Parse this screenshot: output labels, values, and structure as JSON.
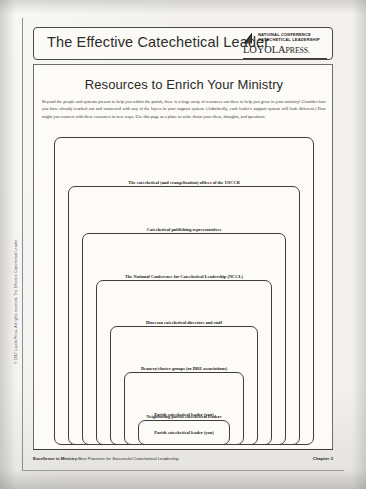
{
  "header": {
    "title": "The Effective Catechetical Leader",
    "logo": {
      "mark_name": "nccl-triangle-mark",
      "line1": "NATIONAL CONFERENCE",
      "line2": "CATECHETICAL LEADERSHIP",
      "wordmark_primary": "LOYOLA",
      "wordmark_secondary": "PRESS."
    }
  },
  "main": {
    "heading": "Resources to Enrich Your Ministry",
    "intro": "Beyond the people and systems present to help you within the parish, there is a large array of resources out there to help you grow in your ministry! Consider how you have already reached out and connected with any of the layers in your support system. (Admittedly, each leader's support system will look different.) How might you connect with these resources in new ways. Use this page as a place to write down your ideas, thoughts, and questions."
  },
  "diagram": {
    "type": "nested-layers",
    "layers": [
      {
        "label": "",
        "level": 1
      },
      {
        "label": "The catechetical (and evangelization) offices of the USCCB",
        "level": 2
      },
      {
        "label": "Catechetical publishing representatives",
        "level": 3
      },
      {
        "label": "The National Conference for Catechetical Leadership (NCCL)",
        "level": 4
      },
      {
        "label": "Diocesan catechetical directors and staff",
        "level": 5
      },
      {
        "label": "Deanery/cluster groups (or DRE associations)",
        "level": 6
      },
      {
        "label": "Neighboring-parish catechetical leaders",
        "level": 7
      },
      {
        "label": "Parish catechetical leader (you)",
        "level": 8
      }
    ]
  },
  "margin_credit": "© 2017 Loyola Press. All rights reserved. The Effective Catechetical Leader",
  "footer": {
    "book_title": "Excellence in Ministry:",
    "book_subtitle": "Best Practices for Successful Catechetical Leadership",
    "chapter": "Chapter 3"
  }
}
